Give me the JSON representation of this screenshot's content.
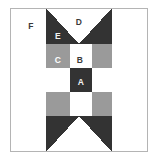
{
  "figure": {
    "name": "quilt-block-diagram",
    "block_type": "variable-star-quilt-block",
    "width": 158,
    "height": 162
  },
  "colors": {
    "dark": "#333333",
    "gray": "#9a9a9a",
    "white": "#ffffff",
    "frame": "#b4b4b4",
    "label_light": "#f2f2f2",
    "label_dark": "#3a3a3a"
  },
  "frame": {
    "x": 10,
    "y": 8,
    "width": 138,
    "height": 144
  },
  "grid": {
    "cols": [
      10,
      46,
      82,
      112,
      148
    ],
    "rows": [
      8,
      44,
      80,
      116,
      152
    ]
  },
  "labels": [
    {
      "id": "A",
      "text": "A",
      "x": 81,
      "y": 83,
      "on": "dark",
      "piece": "center-square"
    },
    {
      "id": "B",
      "text": "B",
      "x": 80,
      "y": 61,
      "on": "light",
      "piece": "nine-patch-white-square"
    },
    {
      "id": "C",
      "text": "C",
      "x": 58,
      "y": 61,
      "on": "gray",
      "piece": "nine-patch-gray-square"
    },
    {
      "id": "D",
      "text": "D",
      "x": 79,
      "y": 23,
      "on": "light",
      "piece": "flying-geese-white-triangle"
    },
    {
      "id": "E",
      "text": "E",
      "x": 58,
      "y": 37,
      "on": "dark",
      "piece": "flying-geese-dark-triangle"
    },
    {
      "id": "F",
      "text": "F",
      "x": 31,
      "y": 27,
      "on": "light",
      "piece": "corner-square"
    }
  ],
  "pieces": {
    "corners": [
      {
        "name": "corner-top-left",
        "fill": "white",
        "points": "10,8 46,8 46,44 10,44"
      },
      {
        "name": "corner-top-right",
        "fill": "white",
        "points": "112,8 148,8 148,44 112,44"
      },
      {
        "name": "corner-bottom-left",
        "fill": "white",
        "points": "10,116 46,116 46,152 10,152"
      },
      {
        "name": "corner-bottom-right",
        "fill": "white",
        "points": "112,116 148,116 148,152 112,152"
      }
    ],
    "geese": [
      {
        "name": "geese-top",
        "dark_left": "46,8 79,44 46,44",
        "dark_right": "112,8 112,44 79,44",
        "white": "46,8 112,8 79,44"
      },
      {
        "name": "geese-bottom",
        "dark_left": "46,152 79,116 46,116",
        "dark_right": "112,152 112,116 79,116",
        "white": "46,152 112,152 79,116"
      },
      {
        "name": "geese-left",
        "dark_left": "10,44 46,80 10,80",
        "dark_right": "10,116 10,80 46,80",
        "white": "10,44 10,116 46,80"
      },
      {
        "name": "geese-right",
        "dark_left": "148,44 112,80 148,80",
        "dark_right": "148,116 148,80 112,80",
        "white": "148,44 148,116 112,80"
      }
    ],
    "nine_patch": [
      {
        "name": "nine-patch-r1c1",
        "fill": "gray",
        "x": 46,
        "y": 44,
        "w": 24,
        "h": 24
      },
      {
        "name": "nine-patch-r1c2",
        "fill": "white",
        "x": 70,
        "y": 44,
        "w": 22,
        "h": 24
      },
      {
        "name": "nine-patch-r1c3",
        "fill": "gray",
        "x": 92,
        "y": 44,
        "w": 20,
        "h": 24
      },
      {
        "name": "nine-patch-r2c1",
        "fill": "white",
        "x": 46,
        "y": 68,
        "w": 24,
        "h": 24
      },
      {
        "name": "nine-patch-r2c2",
        "fill": "dark",
        "x": 70,
        "y": 68,
        "w": 22,
        "h": 24
      },
      {
        "name": "nine-patch-r2c3",
        "fill": "white",
        "x": 92,
        "y": 68,
        "w": 20,
        "h": 24
      },
      {
        "name": "nine-patch-r3c1",
        "fill": "gray",
        "x": 46,
        "y": 92,
        "w": 24,
        "h": 24
      },
      {
        "name": "nine-patch-r3c2",
        "fill": "white",
        "x": 70,
        "y": 92,
        "w": 22,
        "h": 24
      },
      {
        "name": "nine-patch-r3c3",
        "fill": "gray",
        "x": 92,
        "y": 92,
        "w": 20,
        "h": 24
      }
    ]
  }
}
